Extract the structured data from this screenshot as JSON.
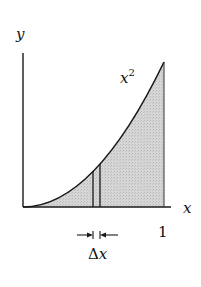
{
  "diagram": {
    "axis_labels": {
      "y": "y",
      "x": "x"
    },
    "curve_label": {
      "base": "x",
      "exponent": "2"
    },
    "tick_labels": {
      "x_end": "1"
    },
    "strip_label": {
      "delta": "Δ",
      "var": "x"
    },
    "colors": {
      "stroke": "#1a1a1a",
      "shade": "#cfcfcf",
      "background": "#ffffff"
    }
  }
}
